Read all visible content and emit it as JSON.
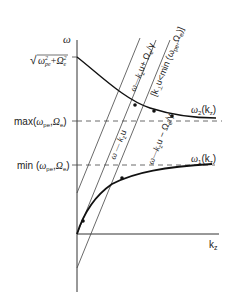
{
  "diagram": {
    "axes": {
      "y_label": "ω",
      "x_label": "k",
      "x_label_sub": "z"
    },
    "y_ticks": {
      "top": "√(ω²pe+Ω²e)",
      "top_parts": {
        "sqrt": "√",
        "a": "ω",
        "a_sup": "2",
        "a_sub": "pe",
        "plus": "+",
        "b": "Ω",
        "b_sup": "2",
        "b_sub": "e"
      },
      "max": "max(ωpe,Ωe)",
      "max_parts": {
        "fn": "max(",
        "a": "ω",
        "a_sub": "pe",
        "comma": ",",
        "b": "Ω",
        "b_sub": "e",
        "close": ")"
      },
      "min": "min (ωpe,Ωe)",
      "min_parts": {
        "fn": "min (",
        "a": "ω",
        "a_sub": "pe",
        "comma": ",",
        "b": "Ω",
        "b_sub": "e",
        "close": ")"
      }
    },
    "curves": {
      "upper": {
        "name": "ω",
        "sub": "2",
        "arg": "(k",
        "arg_sub": "z",
        "close": ")"
      },
      "lower": {
        "name": "ω",
        "sub": "1",
        "arg": "(k",
        "arg_sub": "z",
        "close": ")"
      }
    },
    "lines": {
      "plus": "ω = k_z u + Ω_e/γ",
      "plus_parts": {
        "a": "ω—k",
        "sub": "z",
        "b": "u+ Ω",
        "sub2": "e",
        "c": "/γ"
      },
      "condition": "[k_⊥u<min (ω_pe,Ω_e)]",
      "condition_parts": {
        "a": "[k",
        "sub": "⊥",
        "b": "u<min (ω",
        "sub2": "pe",
        "c": ",Ω",
        "sub3": "e",
        "d": ")]"
      },
      "center": "ω = k_z u",
      "center_parts": {
        "a": "ω — k",
        "sub": "z",
        "b": "u"
      },
      "minus": "ω = k_z u − Ω_e/γ",
      "minus_parts": {
        "a": "ω—k",
        "sub": "z",
        "b": "u − Ω",
        "sub2": "e",
        "c": "/γ"
      }
    },
    "colors": {
      "ink": "#222222",
      "background": "#ffffff"
    }
  }
}
